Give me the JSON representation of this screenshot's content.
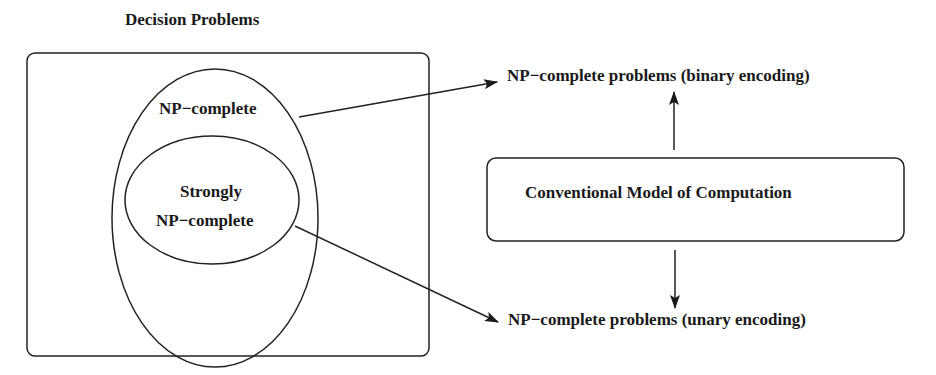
{
  "title": "Decision Problems",
  "sets": {
    "outer_label": "NP−complete",
    "inner_label_line1": "Strongly",
    "inner_label_line2": "NP−complete"
  },
  "model_box": {
    "label": "Conventional Model of Computation"
  },
  "targets": {
    "binary": "NP−complete problems (binary encoding)",
    "unary": "NP−complete problems (unary encoding)"
  },
  "colors": {
    "stroke": "#222222",
    "text": "#1a1a1a",
    "background": "#ffffff"
  }
}
